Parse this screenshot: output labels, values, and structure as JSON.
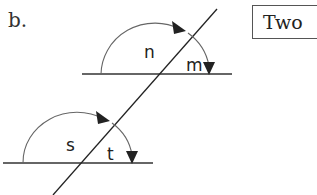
{
  "problem_label": "b.",
  "boxed_text": "Two",
  "angles": {
    "upper_left": "n",
    "upper_right": "m",
    "lower_left": "s",
    "lower_right": "t"
  },
  "colors": {
    "line": "#222222",
    "arc": "#666666"
  }
}
